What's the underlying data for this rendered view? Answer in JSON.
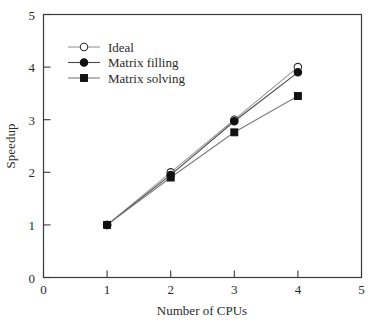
{
  "chart_data": {
    "type": "line",
    "title": "",
    "xlabel": "Number of CPUs",
    "ylabel": "Speedup",
    "xlim": [
      0,
      5
    ],
    "ylim": [
      0,
      5
    ],
    "xticks": [
      "0",
      "1",
      "2",
      "3",
      "4",
      "5"
    ],
    "yticks": [
      "0",
      "1",
      "2",
      "3",
      "4",
      "5"
    ],
    "grid": false,
    "legend_position": "upper-left",
    "x": [
      1,
      2,
      3,
      4
    ],
    "series": [
      {
        "name": "Ideal",
        "marker": "open-circle",
        "color": "#9a9a9a",
        "marker_fill": "#ffffff",
        "marker_stroke": "#2b2b2b",
        "values": [
          1.0,
          2.0,
          3.0,
          4.0
        ]
      },
      {
        "name": "Matrix filling",
        "marker": "filled-circle",
        "color": "#4a4a4a",
        "marker_fill": "#111111",
        "marker_stroke": "#111111",
        "values": [
          1.0,
          1.95,
          2.97,
          3.9
        ]
      },
      {
        "name": "Matrix solving",
        "marker": "filled-square",
        "color": "#7d7d7d",
        "marker_fill": "#111111",
        "marker_stroke": "#111111",
        "values": [
          1.0,
          1.9,
          2.76,
          3.45
        ]
      }
    ]
  },
  "legend": {
    "entries": [
      {
        "label": "Ideal"
      },
      {
        "label": "Matrix filling"
      },
      {
        "label": "Matrix solving"
      }
    ]
  },
  "axes": {
    "x_title": "Number of CPUs",
    "y_title": "Speedup",
    "x_tick_labels": [
      "0",
      "1",
      "2",
      "3",
      "4",
      "5"
    ],
    "y_tick_labels": [
      "0",
      "1",
      "2",
      "3",
      "4",
      "5"
    ]
  }
}
